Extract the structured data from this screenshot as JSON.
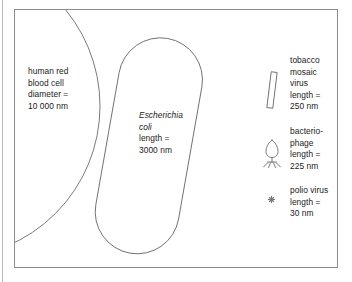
{
  "figure": {
    "background_color": "#ffffff",
    "stroke_color": "#6b6b6b",
    "frame_color": "#8c8c8c",
    "text_color": "#1a1a1a"
  },
  "items": {
    "red_blood_cell": {
      "name": "human red blood cell",
      "line1": "human red",
      "line2": "blood cell",
      "line3": "diameter =",
      "line4": "10 000 nm",
      "measure_type": "diameter",
      "value": "10 000",
      "unit": "nm",
      "shape": "large-circle-arc"
    },
    "escherichia_coli": {
      "name": "Escherichia coli",
      "line1": "Escherichia",
      "line2": "coli",
      "line3": "length =",
      "line4": "3000 nm",
      "measure_type": "length",
      "value": "3000",
      "unit": "nm",
      "shape": "rod-capsule"
    },
    "tobacco_mosaic_virus": {
      "name": "tobacco mosaic virus",
      "line1": "tobacco",
      "line2": "mosaic",
      "line3": "virus",
      "line4": "length =",
      "line5": "250 nm",
      "measure_type": "length",
      "value": "250",
      "unit": "nm",
      "shape": "thin-rod"
    },
    "bacteriophage": {
      "name": "bacteriophage",
      "line1": "bacterio-",
      "line2": "phage",
      "line3": "length =",
      "line4": "225 nm",
      "measure_type": "length",
      "value": "225",
      "unit": "nm",
      "shape": "phage-head-and-legs"
    },
    "polio_virus": {
      "name": "polio virus",
      "line1": "polio virus",
      "line2": "length =",
      "line3": "30 nm",
      "measure_type": "length",
      "value": "30",
      "unit": "nm",
      "shape": "tiny-star"
    }
  }
}
